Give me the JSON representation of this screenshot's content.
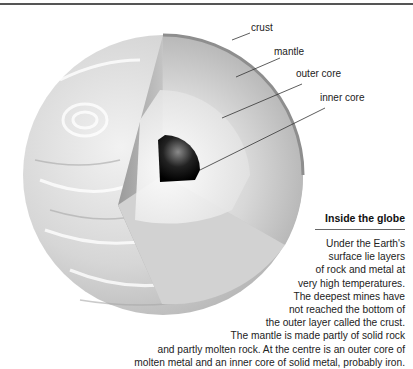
{
  "labels": {
    "crust": "crust",
    "mantle": "mantle",
    "outer_core": "outer core",
    "inner_core": "inner core"
  },
  "caption": {
    "title": "Inside the globe",
    "lines": [
      "Under the Earth's",
      "surface lie layers",
      "of rock and metal at",
      "very high temperatures.",
      "The deepest mines have",
      "not reached the bottom of",
      "the outer layer called the crust.",
      "The mantle is made partly of solid rock",
      "and partly molten rock. At the centre is an outer core of",
      "molten metal and an inner core of solid metal, probably iron."
    ]
  }
}
